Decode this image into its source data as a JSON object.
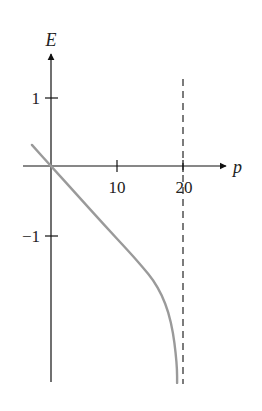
{
  "chart_data": {
    "type": "line",
    "title": "",
    "xlabel": "p",
    "ylabel": "E",
    "xticks": [
      10,
      20
    ],
    "xtick_labels": [
      "10",
      "20"
    ],
    "yticks": [
      1,
      -1
    ],
    "ytick_labels": [
      "1",
      "−1"
    ],
    "xlim": [
      -4,
      27
    ],
    "ylim": [
      -3.2,
      1.75
    ],
    "grid": false,
    "legend": null,
    "series": [
      {
        "name": "E(p)",
        "color": "#9a9a9a",
        "style": "solid",
        "x": [
          -2.9,
          0,
          4,
          8,
          12,
          14,
          15.5,
          16.8,
          17.8,
          18.5,
          18.9,
          19.1,
          19.1
        ],
        "y": [
          0.31,
          0,
          -0.43,
          -0.86,
          -1.28,
          -1.5,
          -1.68,
          -1.9,
          -2.15,
          -2.45,
          -2.75,
          -3.0,
          -3.19
        ]
      }
    ],
    "annotations": [
      {
        "type": "vline",
        "x": 20,
        "style": "dashed",
        "color": "#444444",
        "y_range": [
          -3.2,
          1.3
        ]
      }
    ]
  },
  "labels": {
    "x_axis": "p",
    "y_axis": "E",
    "tick_x_10": "10",
    "tick_x_20": "20",
    "tick_y_1": "1",
    "tick_y_m1": "−1"
  }
}
